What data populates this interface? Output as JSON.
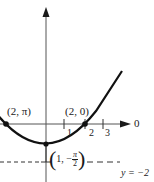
{
  "diagram": {
    "type": "polar-graph",
    "polar_axis": {
      "label": "0",
      "ticks": [
        "1",
        "2",
        "3"
      ]
    },
    "points": [
      {
        "label": "(2, π)",
        "r": "2",
        "theta": "π"
      },
      {
        "label": "(2, 0)",
        "r": "2",
        "theta": "0"
      },
      {
        "label_open": "(1, −",
        "frac_num": "π",
        "frac_den": "2",
        "label_close": ")",
        "r": "1",
        "theta": "−π/2"
      }
    ],
    "directrix": {
      "label": "y = −2",
      "style": "dashed"
    },
    "colors": {
      "ink": "#1a1a1a",
      "background": "#ffffff"
    }
  }
}
